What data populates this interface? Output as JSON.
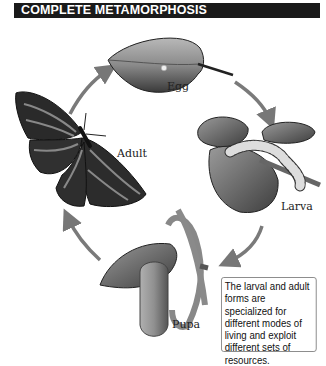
{
  "header": {
    "title": "COMPLETE METAMORPHOSIS"
  },
  "stages": [
    {
      "label": "Egg"
    },
    {
      "label": "Larva"
    },
    {
      "label": "Pupa"
    },
    {
      "label": "Adult"
    }
  ],
  "note": {
    "text": "The larval and adult forms are specialized for different modes of living and exploit different sets of resources."
  },
  "colors": {
    "header_bg": "#1a1a1a",
    "arrow": "#777777"
  }
}
